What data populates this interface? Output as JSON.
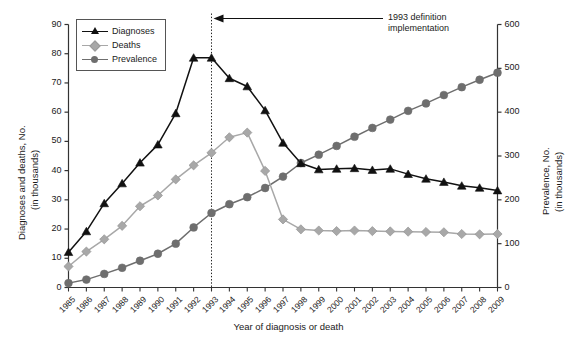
{
  "chart_data": {
    "type": "line",
    "title": "",
    "xlabel": "Year of diagnosis or death",
    "ylabel": "Diagnoses and deaths, No. (in thousands)",
    "ylabel_line1": "Diagnoses and deaths, No.",
    "ylabel_line2": "(in thousands)",
    "y2label": "Prevalence, No. (in thousands)",
    "y2label_line1": "Prevalence, No.",
    "y2label_line2": "(in thousands)",
    "grid": false,
    "legend_position": "top-left",
    "ylim": [
      0,
      90
    ],
    "y2lim": [
      0,
      600
    ],
    "yticks": [
      "0",
      "10",
      "20",
      "30",
      "40",
      "50",
      "60",
      "70",
      "80",
      "90"
    ],
    "y2ticks": [
      "0",
      "100",
      "200",
      "300",
      "400",
      "500",
      "600"
    ],
    "categories": [
      "1985",
      "1986",
      "1987",
      "1988",
      "1989",
      "1990",
      "1991",
      "1992",
      "1993",
      "1994",
      "1995",
      "1996",
      "1997",
      "1998",
      "1999",
      "2000",
      "2001",
      "2002",
      "2003",
      "2004",
      "2005",
      "2006",
      "2007",
      "2008",
      "2009"
    ],
    "x": [
      1985,
      1986,
      1987,
      1988,
      1989,
      1990,
      1991,
      1992,
      1993,
      1994,
      1995,
      1996,
      1997,
      1998,
      1999,
      2000,
      2001,
      2002,
      2003,
      2004,
      2005,
      2006,
      2007,
      2008,
      2009
    ],
    "series": [
      {
        "name": "Diagnoses",
        "axis": "left",
        "color": "#111111",
        "marker": "triangle",
        "values": [
          12.1,
          19.2,
          28.8,
          35.6,
          42.7,
          48.9,
          59.6,
          78.6,
          78.6,
          71.6,
          68.8,
          60.6,
          49.5,
          42.5,
          40.4,
          40.6,
          40.8,
          40.2,
          40.6,
          38.8,
          37.2,
          36.1,
          34.8,
          34.1,
          33.2
        ]
      },
      {
        "name": "Deaths",
        "axis": "left",
        "color": "#a8a8a8",
        "marker": "diamond",
        "values": [
          7.2,
          12.3,
          16.5,
          21.1,
          27.8,
          31.5,
          37.0,
          41.8,
          46.1,
          51.4,
          53.0,
          39.9,
          23.3,
          19.9,
          19.5,
          19.3,
          19.5,
          19.3,
          19.2,
          19.1,
          19.0,
          18.9,
          18.3,
          18.2,
          18.3
        ]
      },
      {
        "name": "Prevalence",
        "axis": "right",
        "color": "#6e6e6e",
        "marker": "circle",
        "values": [
          10,
          18,
          31,
          45,
          61,
          77,
          100,
          137,
          170,
          190,
          206,
          227,
          253,
          284,
          303,
          323,
          344,
          364,
          383,
          403,
          420,
          439,
          457,
          474,
          490
        ]
      }
    ],
    "annotation": {
      "line1": "1993 definition",
      "line2": "implementation",
      "marker_year": "1993",
      "style": "dotted-vertical-line-with-arrow"
    }
  },
  "legend": {
    "items": [
      {
        "label": "Diagnoses",
        "marker": "triangle-marker-icon"
      },
      {
        "label": "Deaths",
        "marker": "diamond-marker-icon"
      },
      {
        "label": "Prevalence",
        "marker": "circle-marker-icon"
      }
    ]
  },
  "colors": {
    "diagnoses": "#111111",
    "deaths": "#a8a8a8",
    "prevalence": "#6e6e6e",
    "axis": "#333333",
    "background": "#ffffff"
  }
}
